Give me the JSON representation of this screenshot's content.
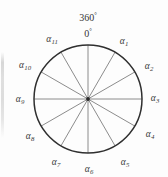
{
  "figure": {
    "name": "circle-angle-divisions-diagram",
    "background_color": "#fdfdfd",
    "circle": {
      "center_x": 88,
      "center_y": 99,
      "radius": 54,
      "stroke_color": "#2f2f2f",
      "stroke_width": 1.5,
      "fill": "none"
    },
    "spokes": {
      "count": 12,
      "angle_step_degrees": 30,
      "stroke_color": "#6e6e6e",
      "stroke_width": 0.8
    },
    "degree_labels": [
      {
        "id": "deg-360",
        "text": "360",
        "unit": "°",
        "x": 88,
        "y": 17
      },
      {
        "id": "deg-0",
        "text": "0",
        "unit": "°",
        "x": 88,
        "y": 33
      }
    ],
    "alpha_labels": [
      {
        "id": "alpha-1",
        "base": "α",
        "sub": "1",
        "x": 124,
        "y": 42,
        "angle_degrees": 30
      },
      {
        "id": "alpha-2",
        "base": "α",
        "sub": "2",
        "x": 149,
        "y": 67,
        "angle_degrees": 60
      },
      {
        "id": "alpha-3",
        "base": "α",
        "sub": "3",
        "x": 155,
        "y": 99,
        "angle_degrees": 90
      },
      {
        "id": "alpha-4",
        "base": "α",
        "sub": "4",
        "x": 150,
        "y": 135,
        "angle_degrees": 120
      },
      {
        "id": "alpha-5",
        "base": "α",
        "sub": "5",
        "x": 125,
        "y": 163,
        "angle_degrees": 150
      },
      {
        "id": "alpha-6",
        "base": "α",
        "sub": "6",
        "x": 89,
        "y": 170,
        "angle_degrees": 180
      },
      {
        "id": "alpha-7",
        "base": "α",
        "sub": "7",
        "x": 56,
        "y": 163,
        "angle_degrees": 210
      },
      {
        "id": "alpha-8",
        "base": "α",
        "sub": "8",
        "x": 30,
        "y": 137,
        "angle_degrees": 240
      },
      {
        "id": "alpha-9",
        "base": "α",
        "sub": "9",
        "x": 20,
        "y": 100,
        "angle_degrees": 270
      },
      {
        "id": "alpha-10",
        "base": "α",
        "sub": "10",
        "x": 25,
        "y": 66,
        "angle_degrees": 300
      },
      {
        "id": "alpha-11",
        "base": "α",
        "sub": "11",
        "x": 52,
        "y": 40,
        "angle_degrees": 330
      }
    ]
  }
}
